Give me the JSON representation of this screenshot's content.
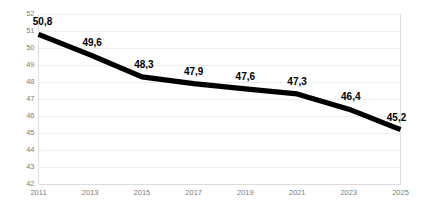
{
  "chart_data": {
    "type": "line",
    "title": "",
    "subtitle": "",
    "xlabel": "",
    "ylabel": "",
    "categories": [
      "2011",
      "2013",
      "2015",
      "2017",
      "2019",
      "2021",
      "2023",
      "2025"
    ],
    "x": [
      2011,
      2013,
      2015,
      2017,
      2019,
      2021,
      2023,
      2025
    ],
    "values": [
      50.8,
      49.6,
      48.3,
      47.9,
      47.6,
      47.3,
      46.4,
      45.2
    ],
    "point_labels": [
      "50,8",
      "49,6",
      "48,3",
      "47,9",
      "47,6",
      "47,3",
      "46,4",
      "45,2"
    ],
    "ylim": [
      42,
      52
    ],
    "xlim": [
      2011,
      2025
    ],
    "y_ticks": [
      42,
      43,
      44,
      45,
      46,
      47,
      48,
      49,
      50,
      51,
      52
    ],
    "y_tick_labels": [
      "42",
      "43",
      "44",
      "45",
      "46",
      "47",
      "48",
      "49",
      "50",
      "51",
      "52"
    ],
    "x_ticks": [
      2011,
      2013,
      2015,
      2017,
      2019,
      2021,
      2023,
      2025
    ],
    "x_tick_labels": [
      "2011",
      "2013",
      "2015",
      "2017",
      "2019",
      "2021",
      "2023",
      "2025"
    ],
    "grid": true,
    "grid_axis": "y",
    "legend": false,
    "legend_position": "none",
    "decimal_separator": ",",
    "series": [
      {
        "name": "",
        "values": [
          50.8,
          49.6,
          48.3,
          47.9,
          47.6,
          47.3,
          46.4,
          45.2
        ],
        "color": "#000000",
        "line_width": 5.2,
        "markers": false
      }
    ],
    "annotations": []
  },
  "style": {
    "background": "#ffffff",
    "line_color": "#000000",
    "grid_color": "#ebebeb",
    "axis_color": "#d9d9d9",
    "tick_label_color": "#7d7d7d",
    "data_label_color": "#000000"
  }
}
